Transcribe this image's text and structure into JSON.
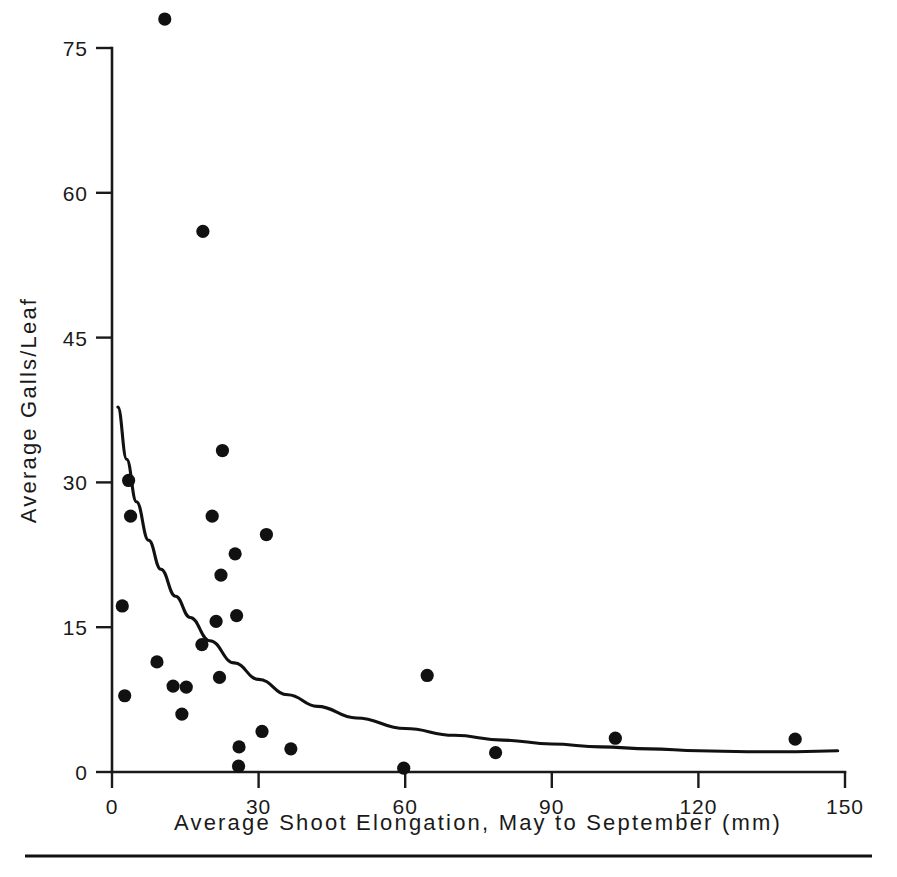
{
  "chart_data": {
    "type": "scatter",
    "title": "",
    "xlabel": "Average Shoot Elongation, May to September  (mm)",
    "ylabel": "Average Galls/Leaf",
    "xlim": [
      0,
      150
    ],
    "ylim": [
      0,
      75
    ],
    "xticks": [
      0,
      30,
      60,
      90,
      120,
      150
    ],
    "yticks": [
      0,
      15,
      30,
      45,
      60,
      75
    ],
    "xticklabels": [
      "0",
      "30",
      "60",
      "90",
      "120",
      "150"
    ],
    "yticklabels": [
      "0",
      "15",
      "30",
      "45",
      "60",
      "75"
    ],
    "grid": false,
    "legend": null,
    "series": [
      {
        "name": "Observations",
        "marker": "filled-circle",
        "color": "#111111",
        "points": [
          [
            10.8,
            78.0
          ],
          [
            18.6,
            56.0
          ],
          [
            22.6,
            33.3
          ],
          [
            3.4,
            30.2
          ],
          [
            20.5,
            26.5
          ],
          [
            3.8,
            26.5
          ],
          [
            31.6,
            24.6
          ],
          [
            25.2,
            22.6
          ],
          [
            22.3,
            20.4
          ],
          [
            2.1,
            17.2
          ],
          [
            21.3,
            15.6
          ],
          [
            25.5,
            16.2
          ],
          [
            18.4,
            13.2
          ],
          [
            64.5,
            10.0
          ],
          [
            9.2,
            11.4
          ],
          [
            22.0,
            9.8
          ],
          [
            12.5,
            8.9
          ],
          [
            15.2,
            8.8
          ],
          [
            2.6,
            7.9
          ],
          [
            14.3,
            6.0
          ],
          [
            30.7,
            4.2
          ],
          [
            103.0,
            3.5
          ],
          [
            139.8,
            3.4
          ],
          [
            26.0,
            2.6
          ],
          [
            36.6,
            2.4
          ],
          [
            78.5,
            2.0
          ],
          [
            25.9,
            0.6
          ],
          [
            59.7,
            0.4
          ]
        ]
      }
    ],
    "fit_curve": {
      "name": "Fitted decay curve",
      "color": "#111111",
      "points": [
        [
          1.2,
          37.8
        ],
        [
          3.0,
          32.4
        ],
        [
          5.0,
          28.0
        ],
        [
          7.5,
          24.0
        ],
        [
          10.0,
          21.0
        ],
        [
          13.0,
          18.2
        ],
        [
          16.0,
          16.0
        ],
        [
          20.0,
          13.6
        ],
        [
          25.0,
          11.3
        ],
        [
          30.0,
          9.6
        ],
        [
          36.0,
          8.0
        ],
        [
          42.0,
          6.8
        ],
        [
          50.0,
          5.6
        ],
        [
          60.0,
          4.5
        ],
        [
          70.0,
          3.8
        ],
        [
          80.0,
          3.3
        ],
        [
          90.0,
          2.9
        ],
        [
          100.0,
          2.6
        ],
        [
          110.0,
          2.4
        ],
        [
          120.0,
          2.2
        ],
        [
          130.0,
          2.1
        ],
        [
          140.0,
          2.1
        ],
        [
          148.5,
          2.2
        ]
      ]
    }
  },
  "figure": {
    "footer_rule_present": "true"
  }
}
